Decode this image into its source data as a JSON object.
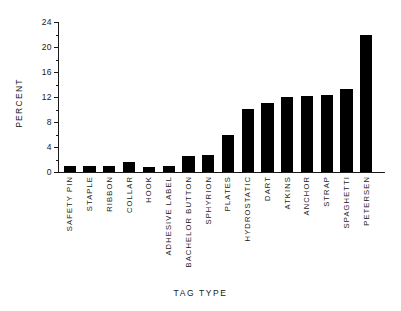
{
  "chart_data": {
    "type": "bar",
    "title": "",
    "xlabel": "TAG TYPE",
    "ylabel": "PERCENT",
    "ylim": [
      0,
      24
    ],
    "yticks": [
      0,
      4,
      8,
      12,
      16,
      20,
      24
    ],
    "ytick_labels": [
      "0",
      "4",
      "8",
      "12",
      "16",
      "20",
      "24"
    ],
    "yminor_step": 2,
    "grid": false,
    "legend": null,
    "bar_color": "#000000",
    "categories": [
      "SAFETY PIN",
      "STAPLE",
      "RIBBON",
      "COLLAR",
      "HOOK",
      "ADHESIVE LABEL",
      "BACHELOR BUTTON",
      "SPHYRION",
      "PLATES",
      "HYDROSTATIC",
      "DART",
      "ATKINS",
      "ANCHOR",
      "STRAP",
      "SPAGHETTI",
      "PETERSEN"
    ],
    "values": [
      1.0,
      1.0,
      1.0,
      1.6,
      0.8,
      1.0,
      2.5,
      2.7,
      6.0,
      10.1,
      11.1,
      12.0,
      12.2,
      12.4,
      13.3,
      22.0
    ]
  }
}
